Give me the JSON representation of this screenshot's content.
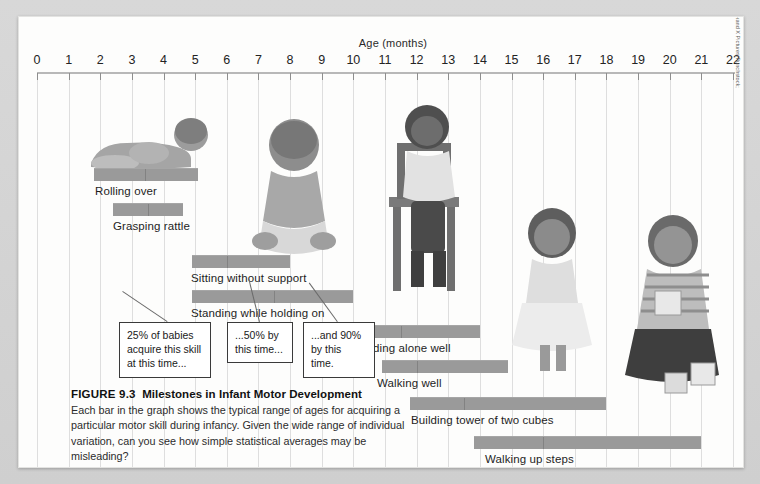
{
  "figure": {
    "axis_title": "Age (months)",
    "credit": "(left to right) Babies Photolibrary/Alamy; Image Source/Getty Images; Brand X Pictures/Punchstock; Katie Mosso/Jupiter Images; Jupiter Images/BananaStock/Alamy"
  },
  "caption": {
    "figure_number": "FIGURE 9.3",
    "title": "Milestones in Infant Motor Development",
    "body": "Each bar in the graph shows the typical range of ages for acquiring a particular motor skill during infancy. Given the wide range of individual variation, can you see how simple statistical averages may be misleading?"
  },
  "callouts": [
    {
      "id": "callout-25",
      "text": "25% of babies acquire this skill at this time..."
    },
    {
      "id": "callout-50",
      "text": "...50% by this time..."
    },
    {
      "id": "callout-90",
      "text": "...and 90% by this time."
    }
  ],
  "chart_data": {
    "type": "bar",
    "orientation": "horizontal-range",
    "title": "Milestones in Infant Motor Development",
    "xlabel": "Age (months)",
    "ylabel": "",
    "xlim": [
      0,
      22
    ],
    "xticks": [
      0,
      1,
      2,
      3,
      4,
      5,
      6,
      7,
      8,
      9,
      10,
      11,
      12,
      13,
      14,
      15,
      16,
      17,
      18,
      19,
      20,
      21,
      22
    ],
    "xticklabels": [
      "0",
      "1",
      "2",
      "3",
      "4",
      "5",
      "6",
      "7",
      "8",
      "9",
      "10",
      "11",
      "12",
      "13",
      "14",
      "15",
      "16",
      "17",
      "18",
      "19",
      "20",
      "21",
      "22"
    ],
    "grid": true,
    "legend": "none",
    "value_key": [
      "start_25pct",
      "median_50pct",
      "end_90pct"
    ],
    "categories": [
      "Rolling over",
      "Grasping rattle",
      "Sitting without support",
      "Standing while holding on",
      "Standing alone well",
      "Walking well",
      "Building tower of two cubes",
      "Walking up steps"
    ],
    "bars": [
      {
        "label": "Rolling over",
        "start_25pct": 1.8,
        "median_50pct": 3.4,
        "end_90pct": 5.1
      },
      {
        "label": "Grasping rattle",
        "start_25pct": 2.4,
        "median_50pct": 3.5,
        "end_90pct": 4.6
      },
      {
        "label": "Sitting without support",
        "start_25pct": 4.9,
        "median_50pct": 6.0,
        "end_90pct": 8.0
      },
      {
        "label": "Standing while holding on",
        "start_25pct": 4.9,
        "median_50pct": 7.5,
        "end_90pct": 10.0
      },
      {
        "label": "Standing alone well",
        "start_25pct": 9.9,
        "median_50pct": 11.5,
        "end_90pct": 14.0
      },
      {
        "label": "Walking well",
        "start_25pct": 10.9,
        "median_50pct": 12.0,
        "end_90pct": 14.9
      },
      {
        "label": "Building tower of two cubes",
        "start_25pct": 11.8,
        "median_50pct": 13.5,
        "end_90pct": 18.0
      },
      {
        "label": "Walking up steps",
        "start_25pct": 13.8,
        "median_50pct": 16.0,
        "end_90pct": 21.0
      }
    ]
  }
}
